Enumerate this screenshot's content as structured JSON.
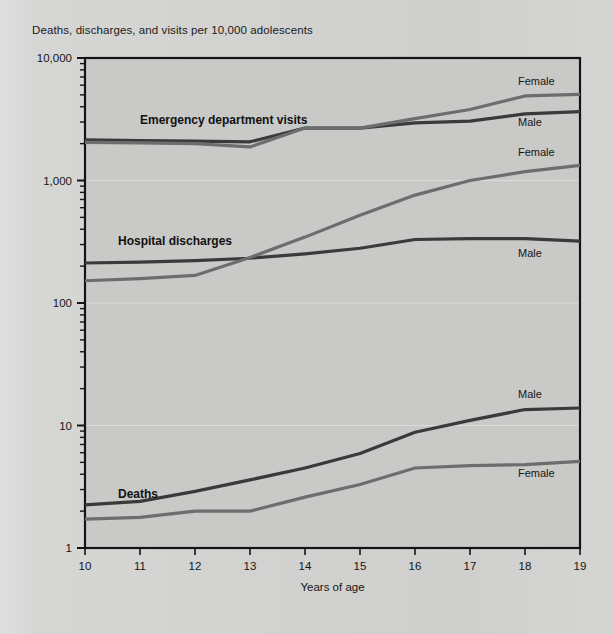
{
  "header": {
    "y_axis_caption": "Deaths, discharges, and visits per 10,000 adolescents"
  },
  "chart_data": {
    "type": "line",
    "title": "",
    "subtitle": "",
    "xlabel": "Years of age",
    "ylabel": "Deaths, discharges, and visits per 10,000 adolescents",
    "yscale": "log",
    "ylim": [
      1,
      10000
    ],
    "ytick_labels": [
      "1",
      "10",
      "100",
      "1,000",
      "10,000"
    ],
    "ytick_values": [
      1,
      10,
      100,
      1000,
      10000
    ],
    "xlim": [
      10,
      19
    ],
    "x": [
      10,
      11,
      12,
      13,
      14,
      15,
      16,
      17,
      18,
      19
    ],
    "xtick_labels": [
      "10",
      "11",
      "12",
      "13",
      "14",
      "15",
      "16",
      "17",
      "18",
      "19"
    ],
    "grid": true,
    "legend_position": "inline-right-of-line-ends",
    "groups": [
      {
        "name": "Emergency department visits",
        "label": "Emergency department visits",
        "label_x": 11.0,
        "label_y": 2900,
        "series": [
          {
            "name": "Male",
            "label": "Male",
            "color": "#3a3a3a",
            "values": [
              2150,
              2120,
              2100,
              2070,
              2680,
              2680,
              2950,
              3050,
              3500,
              3650
            ]
          },
          {
            "name": "Female",
            "label": "Female",
            "color": "#6d6d6d",
            "values": [
              2050,
              2030,
              2000,
              1880,
              2680,
              2680,
              3200,
              3800,
              4900,
              5050
            ]
          }
        ]
      },
      {
        "name": "Hospital discharges",
        "label": "Hospital discharges",
        "label_x": 10.6,
        "label_y": 300,
        "series": [
          {
            "name": "Male",
            "label": "Male",
            "color": "#3a3a3a",
            "values": [
              212,
              216,
              222,
              232,
              252,
              280,
              330,
              335,
              335,
              320
            ]
          },
          {
            "name": "Female",
            "label": "Female",
            "color": "#6d6d6d",
            "values": [
              152,
              158,
              168,
              235,
              345,
              520,
              760,
              1000,
              1180,
              1330
            ]
          }
        ]
      },
      {
        "name": "Deaths",
        "label": "Deaths",
        "label_x": 10.6,
        "label_y": 2.55,
        "series": [
          {
            "name": "Male",
            "label": "Male",
            "color": "#3a3a3a",
            "values": [
              2.25,
              2.4,
              2.9,
              3.6,
              4.5,
              5.9,
              8.8,
              11.0,
              13.5,
              13.9
            ]
          },
          {
            "name": "Female",
            "label": "Female",
            "color": "#6d6d6d",
            "values": [
              1.72,
              1.78,
              2.0,
              2.0,
              2.6,
              3.3,
              4.5,
              4.7,
              4.8,
              5.1
            ]
          }
        ]
      }
    ]
  },
  "end_labels": [
    {
      "text": "Female",
      "group": "Emergency department visits",
      "series": "Female"
    },
    {
      "text": "Male",
      "group": "Emergency department visits",
      "series": "Male"
    },
    {
      "text": "Female",
      "group": "Hospital discharges",
      "series": "Female"
    },
    {
      "text": "Male",
      "group": "Hospital discharges",
      "series": "Male"
    },
    {
      "text": "Male",
      "group": "Deaths",
      "series": "Male"
    },
    {
      "text": "Female",
      "group": "Deaths",
      "series": "Female"
    }
  ],
  "colors": {
    "male": "#3a3a3a",
    "female": "#6d6d6d",
    "page_bg": "#d4d4d2",
    "plot_bg": "#c9c9c7",
    "frame": "#141414",
    "grid": "#dcdcda"
  }
}
